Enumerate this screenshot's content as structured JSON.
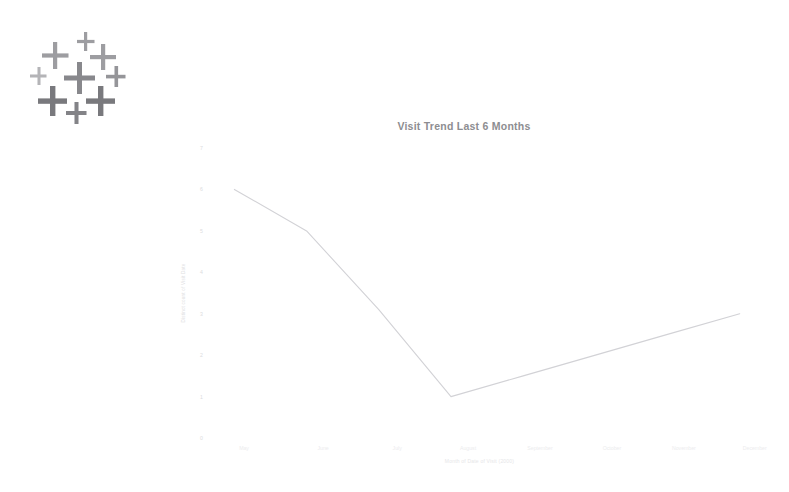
{
  "logo": {
    "name": "cross-cluster-logo",
    "alt": "Cluster of plus symbols logo",
    "color": "#6f6f74"
  },
  "chart_data": {
    "type": "line",
    "title": "Visit Trend Last 6 Months",
    "xlabel": "Month of Date of Visit (2000)",
    "ylabel": "Distinct count of Visit Date",
    "categories": [
      "May",
      "June",
      "July",
      "August",
      "September",
      "October",
      "November",
      "December"
    ],
    "x": [
      "May",
      "June",
      "July",
      "August",
      "September",
      "October",
      "November",
      "December"
    ],
    "values": [
      6,
      5,
      null,
      1,
      null,
      null,
      null,
      3
    ],
    "series": [
      {
        "name": "Distinct count of Visit Date",
        "values": [
          6,
          5,
          3.1,
          1,
          1.5,
          2,
          2.5,
          3
        ]
      }
    ],
    "yticks": [
      "7",
      "6",
      "5",
      "4",
      "3",
      "2",
      "1",
      "0"
    ],
    "ylim": [
      0,
      7
    ],
    "grid": false,
    "legend": false,
    "line_color": "#d2d2d6"
  }
}
